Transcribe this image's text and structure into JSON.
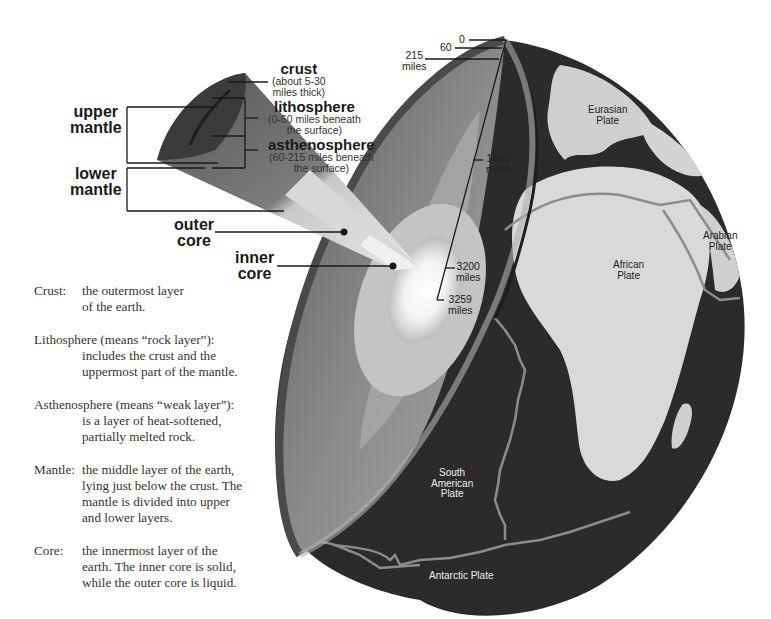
{
  "labels": {
    "crust": {
      "title": "crust",
      "note_line1": "(about 5-30",
      "note_line2": "miles thick)"
    },
    "lithosphere": {
      "title": "lithosphere",
      "note_line1": "(0-60 miles beneath",
      "note_line2": "the surface)"
    },
    "asthenosphere": {
      "title": "asthenosphere",
      "note_line1": "(60-215 miles beneath",
      "note_line2": "the surface)"
    },
    "upper_mantle": {
      "line1": "upper",
      "line2": "mantle"
    },
    "lower_mantle": {
      "line1": "lower",
      "line2": "mantle"
    },
    "outer_core": {
      "line1": "outer",
      "line2": "core"
    },
    "inner_core": {
      "line1": "inner",
      "line2": "core"
    }
  },
  "depth_scale": {
    "d0": "0",
    "d60": "60",
    "d215": {
      "line1": "215",
      "line2": "miles"
    },
    "d1800": {
      "line1": "1800",
      "line2": "miles"
    },
    "d3200": {
      "line1": "3200",
      "line2": "miles"
    },
    "d3259": {
      "line1": "3259",
      "line2": "miles"
    }
  },
  "plates": {
    "eurasian": {
      "line1": "Eurasian",
      "line2": "Plate"
    },
    "arabian": {
      "line1": "Arabian",
      "line2": "Plate"
    },
    "african": {
      "line1": "African",
      "line2": "Plate"
    },
    "south_american": {
      "line1": "South",
      "line2": "American",
      "line3": "Plate"
    },
    "antarctic": "Antarctic Plate"
  },
  "glossary": [
    {
      "term": "Crust:",
      "lines": [
        "the outermost layer",
        "of the earth."
      ]
    },
    {
      "term": "Lithosphere (means “rock layer”):",
      "lines": [
        "includes the crust and the",
        "uppermost part of the mantle."
      ]
    },
    {
      "term": "Asthenosphere (means “weak layer”):",
      "lines": [
        "is a layer of heat-softened,",
        "partially melted rock."
      ]
    },
    {
      "term": "Mantle:",
      "lines": [
        "the middle layer of the earth,",
        "lying just below the crust. The",
        "mantle is divided into upper",
        "and lower layers."
      ]
    },
    {
      "term": "Core:",
      "lines": [
        "the innermost layer of the",
        "earth. The inner core is solid,",
        "while the outer core is liquid."
      ]
    }
  ],
  "colors": {
    "ocean": "#2b2b2b",
    "land": "#d9d9d9",
    "plate_boundary": "#8c8c8c",
    "crust": "#3a3a3a",
    "mantle_upper": "#6e6e6e",
    "mantle_lower": "#8e8e8e",
    "outer_core": "#bdbdbd",
    "inner_core": "#f4f4f4",
    "leader_line": "#1a1a1a"
  }
}
